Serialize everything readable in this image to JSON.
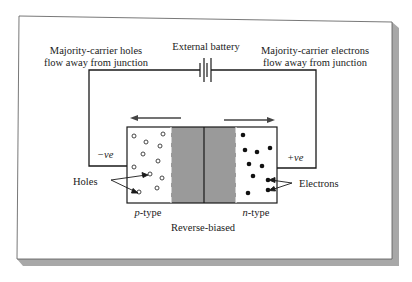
{
  "diagram": {
    "title": "Reverse-biased",
    "labels": {
      "battery": "External battery",
      "left_note_line1": "Majority-carrier holes",
      "left_note_line2": "flow away from junction",
      "right_note_line1": "Majority-carrier electrons",
      "right_note_line2": "flow away from junction",
      "neg_terminal": "−ve",
      "pos_terminal": "+ve",
      "holes": "Holes",
      "electrons": "Electrons",
      "p_region": "p",
      "p_region_suffix": "-type",
      "n_region": "n",
      "n_region_suffix": "-type",
      "caption": "Reverse-biased"
    },
    "regions": [
      {
        "name": "p-type",
        "carrier": "holes",
        "symbol": "open-circle"
      },
      {
        "name": "depletion-region",
        "fill": "#9a9a9a"
      },
      {
        "name": "n-type",
        "carrier": "electrons",
        "symbol": "filled-circle"
      }
    ],
    "arrows": [
      {
        "name": "hole-flow-arrow",
        "direction": "left"
      },
      {
        "name": "electron-flow-arrow",
        "direction": "right"
      }
    ],
    "colors": {
      "line": "#1a1a1a",
      "depletion": "#9a9a9a",
      "frame_shadow": "#a8a8a8",
      "background": "#ffffff"
    }
  }
}
